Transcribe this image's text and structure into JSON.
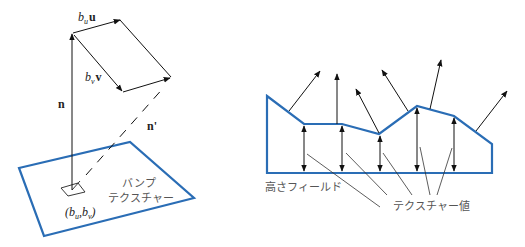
{
  "left_diagram": {
    "labels": {
      "bu_u_base": "b",
      "bu_u_sub": "u",
      "bu_u_vec": "u",
      "bv_v_base": "b",
      "bv_v_sub": "v",
      "bv_v_vec": "v",
      "normal": "n",
      "perturbed_normal": "n'",
      "coord_open": "(b",
      "coord_sub_u": "u",
      "coord_comma": ",b",
      "coord_sub_v": "v",
      "coord_close": ")",
      "bump_texture_line1": "バンプ",
      "bump_texture_line2": "テクスチャー"
    },
    "colors": {
      "plane": "#2a6db5",
      "vectors": "#111111"
    }
  },
  "right_diagram": {
    "labels": {
      "height_field": "高さフィールド",
      "texture_value": "テクスチャー値"
    },
    "colors": {
      "outline": "#2a6db5",
      "arrows": "#111111"
    }
  }
}
